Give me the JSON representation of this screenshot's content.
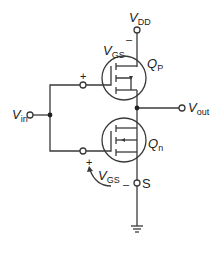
{
  "diagram": {
    "colors": {
      "wire": "#3a3a3a",
      "text": "#222222",
      "background": "#ffffff"
    },
    "labels": {
      "vdd_main": "V",
      "vdd_sub": "DD",
      "vout_main": "V",
      "vout_sub": "out",
      "vin_main": "V",
      "vin_sub": "in",
      "qp_main": "Q",
      "qp_sub": "P",
      "qn_main": "Q",
      "qn_sub": "n",
      "vgs_top_main": "V",
      "vgs_top_sub": "GS",
      "vgs_bottom_main": "V",
      "vgs_bottom_sub": "GS",
      "source": "S",
      "plus_top": "+",
      "minus_top": "–",
      "plus_bottom": "+",
      "minus_bottom": "–"
    },
    "components": [
      {
        "id": "Qp",
        "type": "PMOS transistor"
      },
      {
        "id": "Qn",
        "type": "NMOS transistor"
      }
    ],
    "nodes": [
      "VDD",
      "Vin",
      "Vout",
      "S",
      "ground"
    ]
  }
}
